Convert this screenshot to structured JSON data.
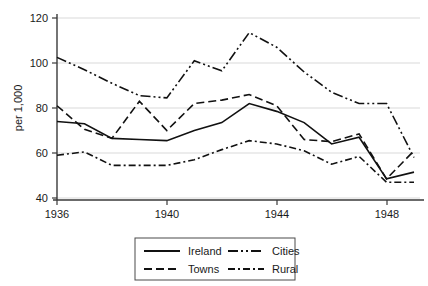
{
  "chart_data": {
    "type": "line",
    "title": "",
    "subtitle": "",
    "xlabel": "",
    "ylabel": "per 1,000",
    "xlim": [
      1936,
      1949
    ],
    "ylim": [
      40,
      120
    ],
    "xticks": [
      1936,
      1940,
      1944,
      1948
    ],
    "xtick_labels": [
      "1936",
      "1940",
      "1944",
      "1948"
    ],
    "yticks": [
      40,
      60,
      80,
      100,
      120
    ],
    "ytick_labels": [
      "40",
      "60",
      "80",
      "100",
      "120"
    ],
    "grid": "horizontal",
    "legend_position": "bottom-center",
    "legend_entries": [
      "Ireland",
      "Towns",
      "Cities",
      "Rural"
    ],
    "x": [
      1936,
      1937,
      1938,
      1939,
      1940,
      1941,
      1942,
      1943,
      1944,
      1945,
      1946,
      1947,
      1948,
      1949
    ],
    "series": [
      {
        "name": "Ireland",
        "style": "solid",
        "dash": "none",
        "color": "#111111",
        "values": [
          74,
          73,
          66.5,
          66,
          65.5,
          70,
          73.5,
          82,
          78.5,
          73.5,
          64,
          67,
          48.5,
          51.5
        ]
      },
      {
        "name": "Towns",
        "style": "dashed",
        "dash": "8,4",
        "color": "#111111",
        "values": [
          81,
          70.5,
          66.5,
          83,
          70,
          82,
          83.5,
          86,
          81,
          66,
          65,
          68.5,
          48.5,
          61
        ]
      },
      {
        "name": "Cities",
        "style": "dash-dot-dot",
        "dash": "10,3,2,3,2,3",
        "color": "#111111",
        "values": [
          102.5,
          97,
          91,
          85.5,
          84.5,
          101,
          96.5,
          113.5,
          107,
          96,
          87,
          82,
          82,
          58
        ]
      },
      {
        "name": "Rural",
        "style": "dash-dot",
        "dash": "7,3,2,3",
        "color": "#111111",
        "values": [
          59,
          60.5,
          54.5,
          54.5,
          54.5,
          57,
          61.5,
          65.5,
          64,
          61,
          55,
          58.5,
          47,
          47
        ]
      }
    ]
  },
  "axes": {
    "y_axis_label": "per 1,000"
  },
  "legend": {
    "items": [
      {
        "label": "Ireland",
        "style": "solid"
      },
      {
        "label": "Towns",
        "style": "dashed"
      },
      {
        "label": "Cities",
        "style": "dash-dot-dot"
      },
      {
        "label": "Rural",
        "style": "dash-dot"
      }
    ]
  }
}
